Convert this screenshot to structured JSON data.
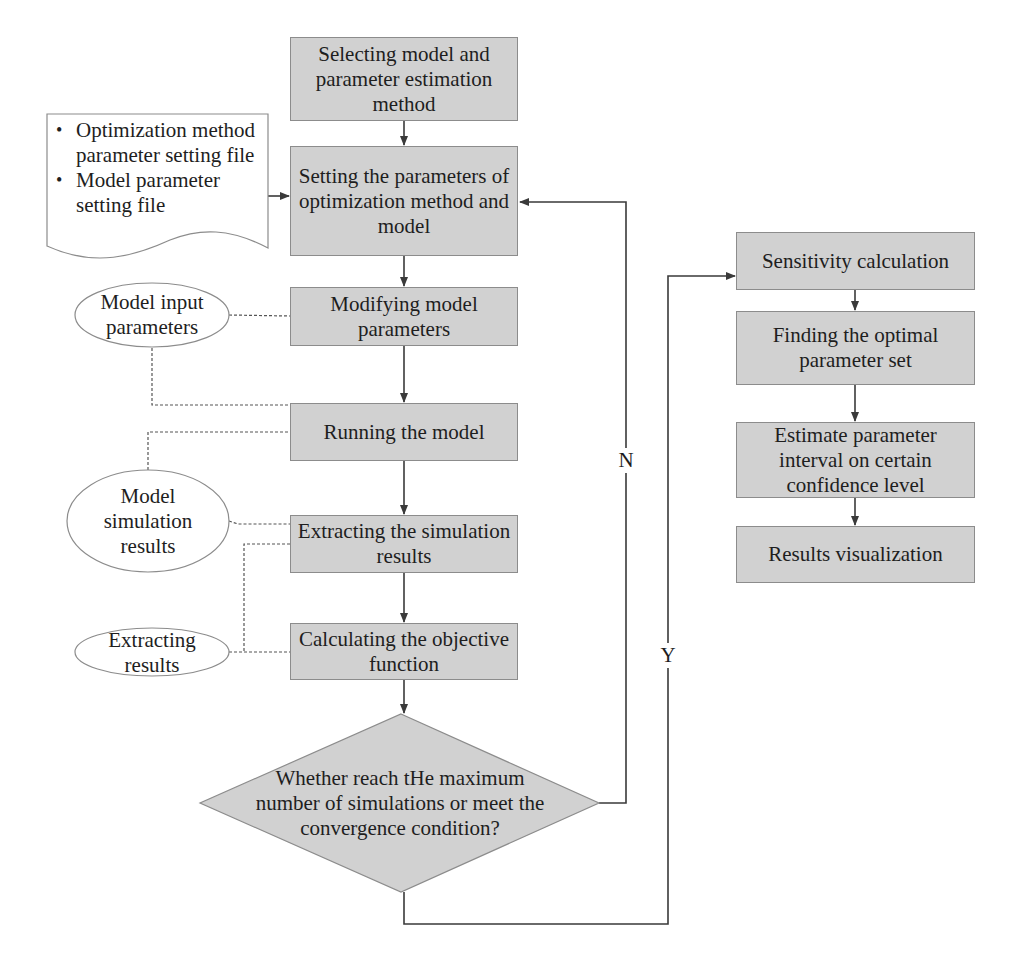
{
  "diagram": {
    "colors": {
      "box_fill": "#d1d1d1",
      "box_border": "#8c8c8c",
      "line": "#3a3a3a",
      "dashed_line": "#555555",
      "background": "#ffffff"
    },
    "main_flow": [
      {
        "id": "select",
        "label": "Selecting model and parameter estimation method"
      },
      {
        "id": "setting",
        "label": "Setting the parameters of optimization method and model"
      },
      {
        "id": "modify",
        "label": "Modifying model parameters"
      },
      {
        "id": "run",
        "label": "Running the model"
      },
      {
        "id": "extract",
        "label": "Extracting the simulation results"
      },
      {
        "id": "objective",
        "label": "Calculating the objective function"
      }
    ],
    "decision": {
      "label": "Whether reach tHe maximum number of simulations or meet the convergence condition?",
      "no_label": "N",
      "yes_label": "Y"
    },
    "post_flow": [
      {
        "id": "sensitivity",
        "label": "Sensitivity calculation"
      },
      {
        "id": "optimal",
        "label": "Finding the optimal parameter set"
      },
      {
        "id": "interval",
        "label": "Estimate parameter interval on certain confidence level"
      },
      {
        "id": "visualize",
        "label": "Results visualization"
      }
    ],
    "document": {
      "bullet": "•",
      "items": [
        "Optimization method parameter setting file",
        "Model parameter setting file"
      ]
    },
    "data_nodes": [
      {
        "id": "input_params",
        "label": "Model input parameters"
      },
      {
        "id": "sim_results",
        "label": "Model simulation results"
      },
      {
        "id": "extract_results",
        "label": "Extracting results"
      }
    ]
  }
}
